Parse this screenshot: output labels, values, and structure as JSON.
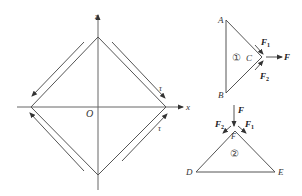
{
  "figure": {
    "colors": {
      "line": "#555555",
      "text": "#333333",
      "background": "#ffffff"
    },
    "left_diagram": {
      "axes": {
        "x_label": "x",
        "z_label": "z",
        "origin_label": "O"
      },
      "shear_labels": {
        "upper_right": "τ",
        "lower_right": "τ"
      },
      "shape": "square rotated 45°, vertices on axes",
      "shear_arrows": [
        {
          "edge": "upper-left",
          "direction": "toward left vertex"
        },
        {
          "edge": "upper-right",
          "direction": "toward right vertex"
        },
        {
          "edge": "lower-right",
          "direction": "toward right vertex"
        },
        {
          "edge": "lower-left",
          "direction": "toward left vertex"
        }
      ]
    },
    "triangle_1": {
      "id_label": "①",
      "vertices": {
        "A": "A",
        "B": "B",
        "C": "C"
      },
      "forces": {
        "F1": "F",
        "F1_sub": "1",
        "F2": "F",
        "F2_sub": "2",
        "F": "F"
      }
    },
    "triangle_2": {
      "id_label": "②",
      "vertices": {
        "D": "D",
        "E": "E",
        "F": "F"
      },
      "forces": {
        "F1": "F",
        "F1_sub": "1",
        "F2": "F",
        "F2_sub": "2",
        "F": "F"
      }
    }
  }
}
